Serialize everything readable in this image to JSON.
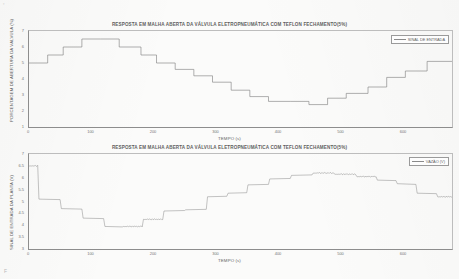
{
  "document": {
    "background_color": "#fbfbfa",
    "ink_color": "#6e6e6e",
    "corner_marks": {
      "top_left": "▫",
      "bottom_left": "F"
    }
  },
  "figures": [
    {
      "id": "fig1",
      "title": "RESPOSTA EM MALHA ABERTA DA VÁLVULA ELETROPNEUMÁTICA COM TEFLON FECHAMENTO(5%)",
      "xlabel": "TEMPO (s)",
      "ylabel": "PORCENTAGEM DE ABERTURA DA VÁLVULA (%)",
      "legend": [
        "SINAL DE ENTRADA"
      ],
      "xticks": [
        "0",
        "100",
        "200",
        "300",
        "400",
        "500",
        "600"
      ],
      "yticks": [
        "7",
        "6",
        "5",
        "4",
        "3",
        "2",
        "1"
      ]
    },
    {
      "id": "fig2",
      "title": "RESPOSTA EM MALHA ABERTA DA VÁLVULA ELETROPNEUMÁTICA COM TEFLON FECHAMENTO(5%)",
      "xlabel": "TEMPO (s)",
      "ylabel": "SINAL DE ENTRADA DA PLANTA (V)",
      "legend": [
        "VAZÃO (V)"
      ],
      "xticks": [
        "0",
        "100",
        "200",
        "300",
        "400",
        "500",
        "600"
      ],
      "yticks": [
        "7",
        "6.5",
        "6",
        "5.5",
        "5",
        "4.5",
        "4",
        "3.5",
        "3"
      ]
    }
  ],
  "chart_data": [
    {
      "type": "line",
      "id": "fig1",
      "title": "RESPOSTA EM MALHA ABERTA DA VÁLVULA ELETROPNEUMÁTICA COM TEFLON FECHAMENTO(5%)",
      "xlabel": "TEMPO (s)",
      "ylabel": "PORCENTAGEM DE ABERTURA DA VÁLVULA (%)",
      "xlim": [
        0,
        680
      ],
      "ylim": [
        1,
        7
      ],
      "grid": false,
      "legend_position": "top-right",
      "series": [
        {
          "name": "SINAL DE ENTRADA",
          "style": "staircase",
          "x": [
            0,
            30,
            30,
            55,
            55,
            85,
            85,
            115,
            115,
            145,
            145,
            180,
            180,
            205,
            205,
            235,
            235,
            265,
            265,
            295,
            295,
            325,
            325,
            355,
            355,
            385,
            385,
            420,
            420,
            450,
            450,
            480,
            480,
            510,
            510,
            545,
            545,
            575,
            575,
            605,
            605,
            640,
            640,
            680
          ],
          "y": [
            5.0,
            5.0,
            5.5,
            5.5,
            6.0,
            6.0,
            6.5,
            6.5,
            6.5,
            6.5,
            6.0,
            6.0,
            5.5,
            5.5,
            5.0,
            5.0,
            4.6,
            4.6,
            4.2,
            4.2,
            3.8,
            3.8,
            3.3,
            3.3,
            2.9,
            2.9,
            2.6,
            2.6,
            2.6,
            2.6,
            2.4,
            2.4,
            2.8,
            2.8,
            3.1,
            3.1,
            3.5,
            3.5,
            4.1,
            4.1,
            4.5,
            4.5,
            5.1,
            5.1
          ]
        }
      ]
    },
    {
      "type": "line",
      "id": "fig2",
      "title": "RESPOSTA EM MALHA ABERTA DA VÁLVULA ELETROPNEUMÁTICA COM TEFLON FECHAMENTO(5%)",
      "xlabel": "TEMPO (s)",
      "ylabel": "SINAL DE ENTRADA DA PLANTA (V)",
      "xlim": [
        0,
        680
      ],
      "ylim": [
        3,
        7
      ],
      "grid": false,
      "legend_position": "top-right",
      "series": [
        {
          "name": "VAZÃO (V)",
          "style": "noisy-staircase",
          "x": [
            0,
            14,
            16,
            50,
            52,
            85,
            87,
            120,
            122,
            150,
            152,
            182,
            184,
            215,
            217,
            250,
            252,
            285,
            287,
            318,
            320,
            350,
            352,
            385,
            387,
            420,
            422,
            455,
            457,
            490,
            492,
            525,
            527,
            558,
            560,
            590,
            592,
            622,
            624,
            655,
            657,
            680
          ],
          "y": [
            6.5,
            6.5,
            5.1,
            5.08,
            4.7,
            4.68,
            4.3,
            4.28,
            3.95,
            3.93,
            3.95,
            3.95,
            4.25,
            4.25,
            4.6,
            4.62,
            4.65,
            4.67,
            5.2,
            5.22,
            5.35,
            5.37,
            5.7,
            5.72,
            5.95,
            5.97,
            6.1,
            6.12,
            6.2,
            6.2,
            6.15,
            6.15,
            6.05,
            6.05,
            5.9,
            5.88,
            5.75,
            5.72,
            5.35,
            5.33,
            5.2,
            5.2
          ]
        }
      ]
    }
  ]
}
